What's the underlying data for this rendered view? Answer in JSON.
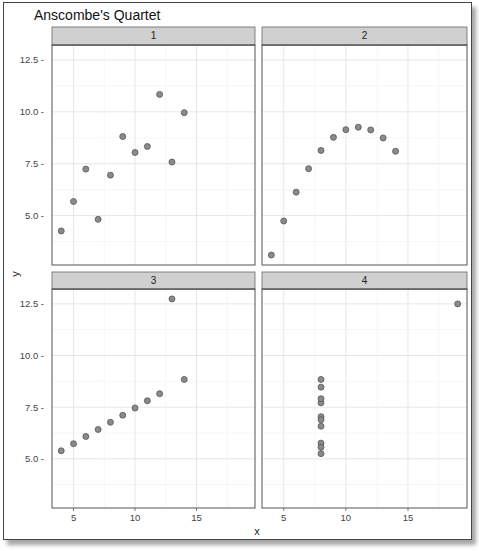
{
  "chart_data": {
    "type": "scatter",
    "title": "Anscombe's Quartet",
    "xlabel": "x",
    "ylabel": "y",
    "facets": [
      "1",
      "2",
      "3",
      "4"
    ],
    "xlim": [
      3.25,
      19.75
    ],
    "ylim": [
      2.62,
      13.22
    ],
    "x_ticks": [
      5,
      10,
      15
    ],
    "y_ticks": [
      5.0,
      7.5,
      10.0,
      12.5
    ],
    "y_tick_labels": [
      "5.0",
      "7.5",
      "10.0",
      "12.5"
    ],
    "x_tick_labels": [
      "5",
      "10",
      "15"
    ],
    "grid": true,
    "legend": null,
    "point_color": "#8a8a8a",
    "point_stroke": "#555555",
    "strip_fill": "#d0d0d0",
    "series": [
      {
        "name": "1",
        "x": [
          10,
          8,
          13,
          9,
          11,
          14,
          6,
          4,
          12,
          7,
          5
        ],
        "y": [
          8.04,
          6.95,
          7.58,
          8.81,
          8.33,
          9.96,
          7.24,
          4.26,
          10.84,
          4.82,
          5.68
        ]
      },
      {
        "name": "2",
        "x": [
          10,
          8,
          13,
          9,
          11,
          14,
          6,
          4,
          12,
          7,
          5
        ],
        "y": [
          9.14,
          8.14,
          8.74,
          8.77,
          9.26,
          8.1,
          6.13,
          3.1,
          9.13,
          7.26,
          4.74
        ]
      },
      {
        "name": "3",
        "x": [
          10,
          8,
          13,
          9,
          11,
          14,
          6,
          4,
          12,
          7,
          5
        ],
        "y": [
          7.46,
          6.77,
          12.74,
          7.11,
          7.81,
          8.84,
          6.08,
          5.39,
          8.15,
          6.42,
          5.73
        ]
      },
      {
        "name": "4",
        "x": [
          8,
          8,
          8,
          8,
          8,
          8,
          8,
          19,
          8,
          8,
          8
        ],
        "y": [
          6.58,
          5.76,
          7.71,
          8.84,
          8.47,
          7.04,
          5.25,
          12.5,
          5.56,
          7.91,
          6.89
        ]
      }
    ]
  }
}
